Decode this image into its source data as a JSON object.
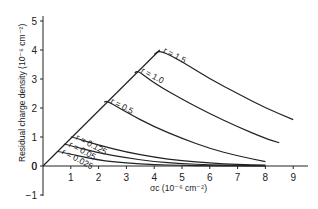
{
  "chart_data": {
    "type": "line",
    "title": "",
    "xlabel": "σc (10⁻⁶ cm⁻²)",
    "ylabel": "Residual charge density (10⁻⁶ cm⁻²)",
    "xlim": [
      0,
      9.5
    ],
    "ylim": [
      -1,
      5
    ],
    "x_ticks": [
      "1",
      "2",
      "3",
      "4",
      "5",
      "6",
      "7",
      "8",
      "9"
    ],
    "y_ticks": [
      "-1",
      "0",
      "1",
      "2",
      "3",
      "4",
      "5"
    ],
    "grid": false,
    "envelope": {
      "name": "linear rise",
      "x": [
        0,
        4.2
      ],
      "y": [
        0,
        4.0
      ]
    },
    "series": [
      {
        "name": "r = 1.5",
        "label": "r = 1.5",
        "x": [
          0,
          4.0,
          4.2,
          5,
          6,
          7,
          8,
          9
        ],
        "y": [
          0,
          3.85,
          4.0,
          3.6,
          3.0,
          2.5,
          2.0,
          1.6
        ]
      },
      {
        "name": "r = 1.0",
        "label": "r = 1.0",
        "x": [
          0,
          3.3,
          3.4,
          4,
          5,
          6,
          7,
          8,
          8.5
        ],
        "y": [
          0,
          3.2,
          3.3,
          2.85,
          2.3,
          1.8,
          1.35,
          0.95,
          0.8
        ]
      },
      {
        "name": "r = 0.5",
        "label": "r = 0.5",
        "x": [
          0,
          2.2,
          2.3,
          3,
          4,
          5,
          6,
          7,
          8
        ],
        "y": [
          0,
          2.2,
          2.25,
          1.85,
          1.35,
          0.95,
          0.6,
          0.35,
          0.15
        ]
      },
      {
        "name": "r = 0.125",
        "label": "r = 0.125",
        "x": [
          0,
          1.0,
          1.05,
          2,
          3,
          4,
          5,
          6,
          7,
          8
        ],
        "y": [
          0,
          1.0,
          1.0,
          0.72,
          0.48,
          0.3,
          0.18,
          0.1,
          0.05,
          0.03
        ]
      },
      {
        "name": "r = 0.05",
        "label": "r = 0.05",
        "x": [
          0,
          0.75,
          0.8,
          2,
          3,
          4,
          5,
          6,
          7,
          8
        ],
        "y": [
          0,
          0.75,
          0.75,
          0.45,
          0.28,
          0.15,
          0.08,
          0.04,
          0.02,
          0.01
        ]
      },
      {
        "name": "r = 0.025",
        "label": "r = 0.025",
        "x": [
          0,
          0.5,
          0.55,
          2,
          3,
          4,
          5,
          6,
          7,
          8
        ],
        "y": [
          0,
          0.5,
          0.5,
          0.2,
          0.1,
          0.05,
          0.02,
          0.01,
          0.0,
          0.0
        ]
      }
    ]
  }
}
